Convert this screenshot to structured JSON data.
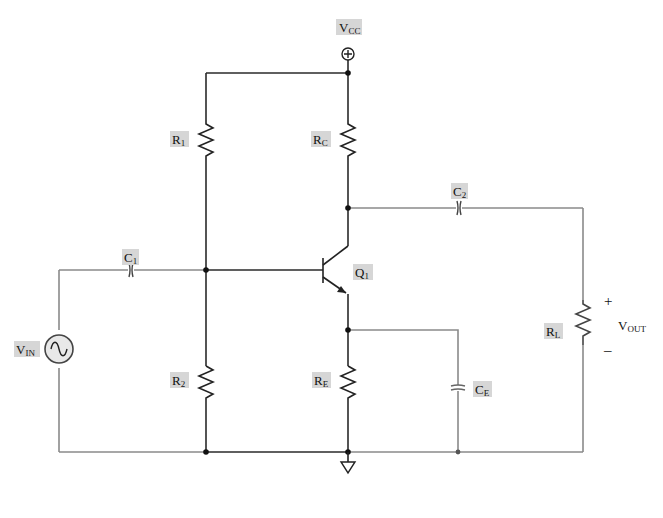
{
  "diagram": {
    "type": "circuit-schematic",
    "colors": {
      "wire": "#2a2a2a",
      "wire_signal": "#8a8a8a",
      "label_background": "#d6d6d6"
    },
    "supply": {
      "main": "V",
      "sub": "CC",
      "symbol": "+"
    },
    "components": {
      "R1": {
        "main": "R",
        "sub": "1"
      },
      "R2": {
        "main": "R",
        "sub": "2"
      },
      "RC": {
        "main": "R",
        "sub": "C"
      },
      "RE": {
        "main": "R",
        "sub": "E"
      },
      "RL": {
        "main": "R",
        "sub": "L"
      },
      "C1": {
        "main": "C",
        "sub": "1"
      },
      "C2": {
        "main": "C",
        "sub": "2"
      },
      "CE": {
        "main": "C",
        "sub": "E"
      },
      "Q1": {
        "main": "Q",
        "sub": "1"
      },
      "VIN": {
        "main": "V",
        "sub": "IN"
      }
    },
    "output": {
      "main": "V",
      "sub": "OUT",
      "plus": "+",
      "minus": "–"
    },
    "ground": {
      "symbol": "ground-triangle"
    }
  }
}
